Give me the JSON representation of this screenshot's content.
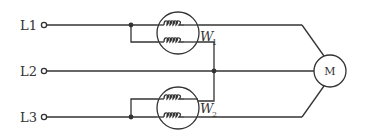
{
  "diagram": {
    "lines": [
      {
        "id": "L1",
        "label": "L1",
        "y": 25
      },
      {
        "id": "L2",
        "label": "L2",
        "y": 71
      },
      {
        "id": "L3",
        "label": "L3",
        "y": 117
      }
    ],
    "wattmeters": [
      {
        "id": "W1",
        "label": "W",
        "subscript": "1",
        "cx": 178,
        "cy": 30
      },
      {
        "id": "W2",
        "label": "W",
        "subscript": "2",
        "cx": 178,
        "cy": 107
      }
    ],
    "load": {
      "id": "M",
      "label": "M",
      "type": "motor"
    },
    "colors": {
      "line": "#333333",
      "background": "#ffffff"
    }
  }
}
